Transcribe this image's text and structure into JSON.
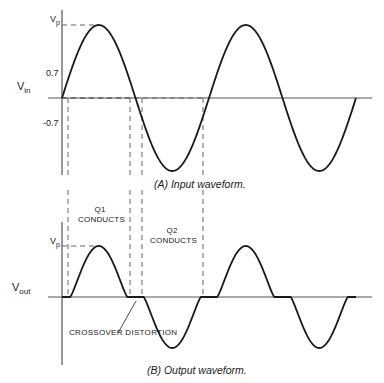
{
  "figure": {
    "panel_a": {
      "caption": "(A) Input waveform.",
      "y_label_main": "V",
      "y_label_sub": "in",
      "ticks": {
        "vp": "V",
        "vp_sub": "p",
        "pos": "0.7",
        "neg": "-0.7"
      }
    },
    "panel_b": {
      "caption": "(B) Output waveform.",
      "y_label_main": "V",
      "y_label_sub": "out",
      "ticks": {
        "vp": "V",
        "vp_sub": "p"
      },
      "q1_label_line1": "Q1",
      "q1_label_line2": "CONDUCTS",
      "q2_label_line1": "Q2",
      "q2_label_line2": "CONDUCTS",
      "annotation": "CROSSOVER DISTORTION"
    },
    "colors": {
      "curve": "#1a1a1a",
      "axis": "#555555",
      "dash": "#555555",
      "background": "#ffffff"
    },
    "geometry": {
      "x_start": 62,
      "period": 147,
      "cycles": 2,
      "a_axis_x": 62,
      "a_axis_top": 10,
      "a_axis_bottom": 175,
      "a_baseline": 98,
      "a_amp": 73,
      "a_h_end": 372,
      "a_level_07": 25,
      "b_axis_x": 62,
      "b_axis_top": 222,
      "b_axis_bottom": 365,
      "b_baseline": 297,
      "b_amp": 51,
      "b_h_end": 372,
      "threshold_ratio": 0.342,
      "dash_x": [
        68,
        130,
        142,
        203
      ]
    }
  }
}
